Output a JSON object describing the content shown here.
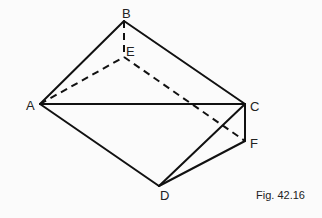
{
  "figure": {
    "caption": "Fig. 42.16",
    "colors": {
      "line": "#111111",
      "background": "#fbfbfb"
    },
    "points": {
      "A": {
        "label": "A",
        "x": 40,
        "y": 104
      },
      "B": {
        "label": "B",
        "x": 124,
        "y": 21
      },
      "E": {
        "label": "E",
        "x": 124,
        "y": 57
      },
      "C": {
        "label": "C",
        "x": 245,
        "y": 104
      },
      "F": {
        "label": "F",
        "x": 245,
        "y": 141
      },
      "D": {
        "label": "D",
        "x": 159,
        "y": 186
      }
    },
    "solid_edges": [
      "AB",
      "BC",
      "AC",
      "AD",
      "CD",
      "CF",
      "DF"
    ],
    "dashed_edges": [
      "BE",
      "AE",
      "EF"
    ]
  }
}
